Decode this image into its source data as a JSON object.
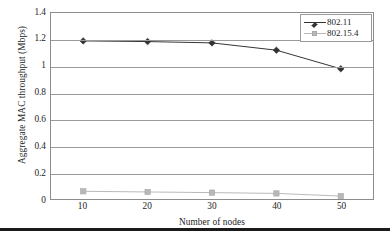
{
  "chart_data": {
    "type": "line",
    "title": "",
    "xlabel": "Number of nodes",
    "ylabel": "Aggregate MAC throughput (Mbps)",
    "categories": [
      "10",
      "20",
      "30",
      "40",
      "50"
    ],
    "x": [
      10,
      20,
      30,
      40,
      50
    ],
    "xlim": [
      5,
      55
    ],
    "ylim": [
      0,
      1.4
    ],
    "yticks": [
      "1.4",
      "1.2",
      "1",
      "0.8",
      "0.6",
      "0.4",
      "0.2",
      "0"
    ],
    "ytick_values": [
      1.4,
      1.2,
      1.0,
      0.8,
      0.6,
      0.4,
      0.2,
      0
    ],
    "grid": "horizontal",
    "legend_position": "top-right-inside",
    "series": [
      {
        "name": "802.11",
        "color": "#333333",
        "marker": "diamond",
        "values": [
          1.19,
          1.185,
          1.175,
          1.12,
          0.98
        ]
      },
      {
        "name": "802.15.4",
        "color": "#b8b8b8",
        "marker": "square",
        "values": [
          0.058,
          0.053,
          0.048,
          0.042,
          0.022
        ]
      }
    ]
  },
  "legend": {
    "items": [
      {
        "label": "802.11"
      },
      {
        "label": "802.15.4"
      }
    ]
  },
  "colors": {
    "series_1": "#333333",
    "series_2": "#b8b8b8",
    "grid": "#9a9a9a",
    "frame": "#8c8c8c",
    "text": "#1c1c1c",
    "rule": "#1a1a1a"
  }
}
